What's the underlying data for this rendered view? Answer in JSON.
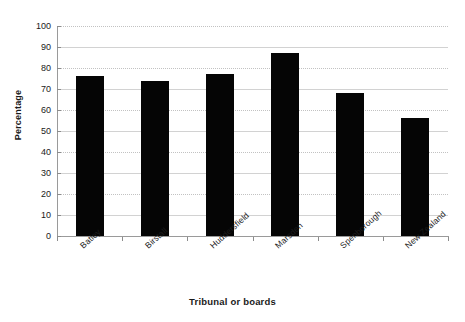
{
  "top_caption": "",
  "chart_data": {
    "type": "bar",
    "title": "",
    "subtitle": "",
    "xlabel": "Tribunal or boards",
    "ylabel": "Percentage",
    "categories": [
      "Batley",
      "Birstall",
      "Huddersfield",
      "Marsden",
      "Spenborough",
      "New Zealand"
    ],
    "values": [
      76,
      74,
      77,
      87,
      68,
      56
    ],
    "series": [
      {
        "name": "Percentage",
        "values": [
          76,
          74,
          77,
          87,
          68,
          56
        ]
      }
    ],
    "ylim": [
      0,
      100
    ],
    "ytick_labels": [
      "0",
      "10",
      "20",
      "30",
      "40",
      "50",
      "60",
      "70",
      "80",
      "90",
      "100"
    ],
    "ytick_values": [
      0,
      10,
      20,
      30,
      40,
      50,
      60,
      70,
      80,
      90,
      100
    ],
    "grid": true,
    "legend": false,
    "legend_position": "none",
    "bar_color": "#050505",
    "gridline_color": "#d2d2d2",
    "axis_color": "#9a9a9a",
    "background_color": "#ffffff",
    "xtick_label_rotation": -42
  }
}
